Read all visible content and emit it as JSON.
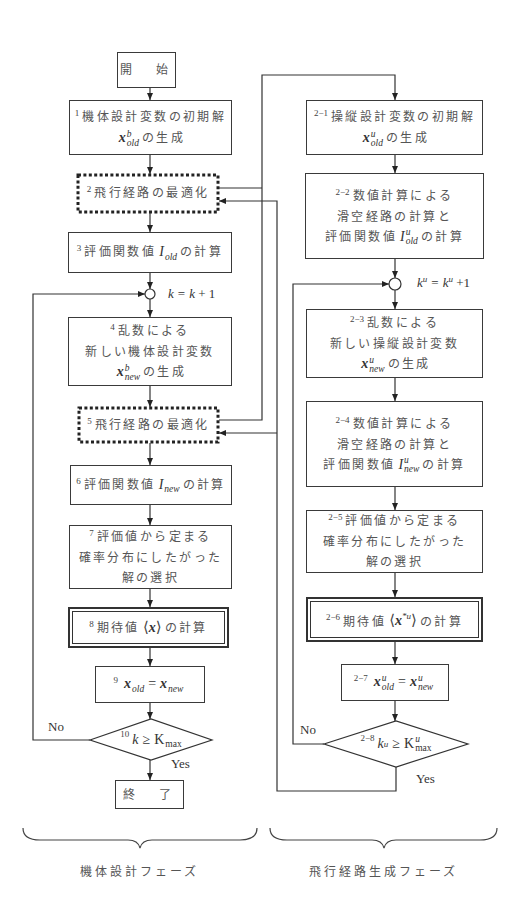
{
  "diagram": {
    "left": {
      "start": {
        "label": "開　始"
      },
      "n1": {
        "num": "1",
        "line1": "機体設計変数の初期解",
        "var": {
          "base": "x",
          "sup": "b",
          "sub": "old"
        },
        "suffix": "の生成"
      },
      "n2": {
        "num": "2",
        "label": "飛行経路の最適化"
      },
      "n3": {
        "num": "3",
        "prefix": "評価関数値",
        "var": {
          "base": "I",
          "sup": "",
          "sub": "old"
        },
        "suffix": "の計算"
      },
      "counter": {
        "lhs": "k",
        "eq": "=",
        "rhs": "k",
        "plus": "+ 1"
      },
      "n4": {
        "num": "4",
        "line1": "乱数による",
        "line2": "新しい機体設計変数",
        "var": {
          "base": "x",
          "sup": "b",
          "sub": "new"
        },
        "suffix": "の生成"
      },
      "n5": {
        "num": "5",
        "label": "飛行経路の最適化"
      },
      "n6": {
        "num": "6",
        "prefix": "評価関数値",
        "var": {
          "base": "I",
          "sup": "",
          "sub": "new"
        },
        "suffix": "の計算"
      },
      "n7": {
        "num": "7",
        "line1": "評価値から定まる",
        "line2": "確率分布にしたがった",
        "line3": "解の選択"
      },
      "n8": {
        "num": "8",
        "prefix": "期待値",
        "expect": {
          "open": "⟨",
          "base": "x",
          "sup": "",
          "close": "⟩"
        },
        "suffix": "の計算"
      },
      "n9": {
        "num": "9",
        "lhs": {
          "base": "x",
          "sup": "",
          "sub": "old"
        },
        "eq": "=",
        "rhs": {
          "base": "x",
          "sup": "",
          "sub": "new"
        }
      },
      "n10": {
        "num": "10",
        "var": {
          "base": "k",
          "sup": ""
        },
        "op": "≥",
        "bound": {
          "base": "K",
          "sup": "",
          "sub": "max"
        },
        "no": "No",
        "yes": "Yes"
      },
      "end": {
        "label": "終　了"
      }
    },
    "right": {
      "n2_1": {
        "num": "2−1",
        "line1": "操縦設計変数の初期解",
        "var": {
          "base": "x",
          "sup": "u",
          "sub": "old"
        },
        "suffix": "の生成"
      },
      "n2_2": {
        "num": "2−2",
        "line1": "数値計算による",
        "line2": "滑空経路の計算と",
        "prefix": "評価関数値",
        "var": {
          "base": "I",
          "sup": "u",
          "sub": "old"
        },
        "suffix": "の計算"
      },
      "counter": {
        "lhs": {
          "base": "k",
          "sup": "u"
        },
        "eq": "=",
        "rhs": {
          "base": "k",
          "sup": "u"
        },
        "plus": "+1"
      },
      "n2_3": {
        "num": "2−3",
        "line1": "乱数による",
        "line2": "新しい操縦設計変数",
        "var": {
          "base": "x",
          "sup": "u",
          "sub": "new"
        },
        "suffix": "の生成"
      },
      "n2_4": {
        "num": "2−4",
        "line1": "数値計算による",
        "line2": "滑空経路の計算と",
        "prefix": "評価関数値",
        "var": {
          "base": "I",
          "sup": "u",
          "sub": "new"
        },
        "suffix": "の計算"
      },
      "n2_5": {
        "num": "2−5",
        "line1": "評価値から定まる",
        "line2": "確率分布にしたがった",
        "line3": "解の選択"
      },
      "n2_6": {
        "num": "2−6",
        "prefix": "期待値",
        "expect": {
          "open": "⟨",
          "base": "x",
          "sup": "*u",
          "close": "⟩"
        },
        "suffix": "の計算"
      },
      "n2_7": {
        "num": "2−7",
        "lhs": {
          "base": "x",
          "sup": "u",
          "sub": "old"
        },
        "eq": "=",
        "rhs": {
          "base": "x",
          "sup": "u",
          "sub": "new"
        }
      },
      "n2_8": {
        "num": "2−8",
        "var": {
          "base": "k",
          "sup": "u"
        },
        "op": "≥",
        "bound": {
          "base": "K",
          "sup": "u",
          "sub": "max"
        },
        "no": "No",
        "yes": "Yes"
      }
    }
  },
  "phases": [
    {
      "label": "機体設計フェーズ"
    },
    {
      "label": "飛行経路生成フェーズ"
    }
  ],
  "colors": {
    "line": "#333333",
    "text": "#555555",
    "background": "#ffffff"
  }
}
